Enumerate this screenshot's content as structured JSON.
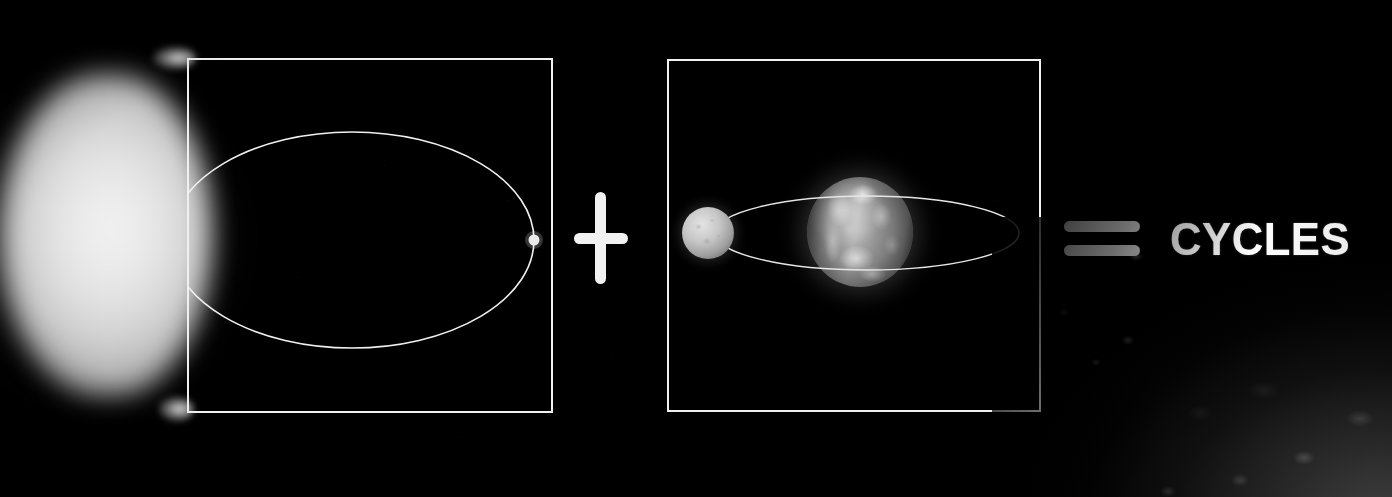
{
  "scene": {
    "background_color": "#000000",
    "accent_color": "#f2f2f2",
    "equation_label": "CYCLES"
  },
  "equation": {
    "left_term": {
      "name": "planet-orbiting-star",
      "caption": "",
      "bodies": [
        {
          "name": "star",
          "label": "Star",
          "kind": "glowing-star"
        },
        {
          "name": "planet",
          "label": "Planet",
          "kind": "small-planet"
        }
      ],
      "orbit": {
        "name": "elliptical-orbit",
        "shape": "ellipse"
      }
    },
    "operator_plus": {
      "symbol": "+",
      "name": "plus-operator"
    },
    "right_term": {
      "name": "moon-orbiting-planet",
      "caption": "",
      "bodies": [
        {
          "name": "earth",
          "label": "Earth",
          "kind": "terrestrial-planet"
        },
        {
          "name": "moon",
          "label": "Moon",
          "kind": "natural-satellite"
        }
      ],
      "orbit": {
        "name": "lunar-orbit",
        "shape": "ellipse"
      }
    },
    "operator_equals": {
      "symbol": "=",
      "name": "equals-operator"
    },
    "result": {
      "text": "CYCLES",
      "name": "result-label"
    }
  },
  "foreground": {
    "lunar_surface": {
      "name": "lunar-surface",
      "label": "Lunar surface"
    }
  }
}
